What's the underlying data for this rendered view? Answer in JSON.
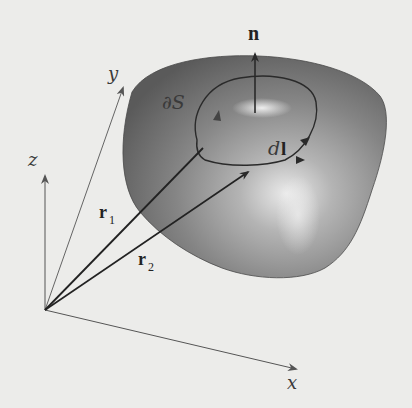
{
  "figure": {
    "labels": {
      "normal": "n",
      "boundary": "∂S",
      "line_element_d": "d",
      "line_element_l": "l",
      "r1_main": "r",
      "r1_sub": "1",
      "r2_main": "r",
      "r2_sub": "2",
      "axis_x": "x",
      "axis_y": "y",
      "axis_z": "z"
    },
    "colors": {
      "background": "#ececea",
      "surface_dark": "#5d5d5d",
      "surface_mid": "#8a8a8a",
      "surface_highlight": "#e6e6e6",
      "lines": "#2a2a2a",
      "axes": "#555555"
    }
  }
}
